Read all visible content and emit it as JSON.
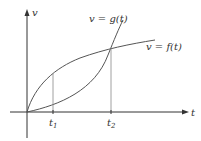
{
  "diagram": {
    "type": "function-graph",
    "axes": {
      "x_label": "t",
      "y_label": "v"
    },
    "curves": [
      {
        "name": "g",
        "label": "v = g(t)"
      },
      {
        "name": "f",
        "label": "v = f(t)"
      }
    ],
    "ticks": [
      {
        "label": "t",
        "subscript": "1"
      },
      {
        "label": "t",
        "subscript": "2"
      }
    ],
    "colors": {
      "axis": "#333333",
      "curve": "#555555",
      "guide": "#888888"
    }
  }
}
